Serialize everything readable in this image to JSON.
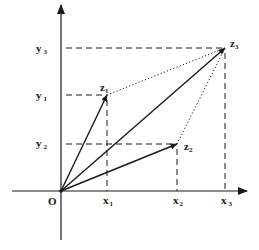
{
  "diagram": {
    "origin_label": "O",
    "points": [
      {
        "id": "z1",
        "label": "z",
        "sub": "1",
        "x": 107,
        "y": 95
      },
      {
        "id": "z2",
        "label": "z",
        "sub": "2",
        "x": 177,
        "y": 144
      },
      {
        "id": "z3",
        "label": "z",
        "sub": "3",
        "x": 225,
        "y": 48
      }
    ],
    "x_ticks": [
      {
        "label": "x",
        "sub": "1"
      },
      {
        "label": "x",
        "sub": "2"
      },
      {
        "label": "x",
        "sub": "3"
      }
    ],
    "y_ticks": [
      {
        "label": "y",
        "sub": "3"
      },
      {
        "label": "y",
        "sub": "1"
      },
      {
        "label": "y",
        "sub": "2"
      }
    ],
    "colors": {
      "line": "#1a1a1a",
      "background": "#ffffff"
    }
  }
}
